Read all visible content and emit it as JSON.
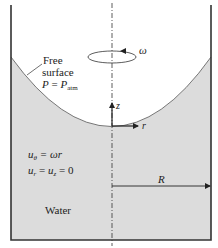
{
  "diagram": {
    "type": "rotating-tank-free-surface",
    "colors": {
      "background": "#ffffff",
      "water": "#dcdcdc",
      "lines": "#222222",
      "text": "#222222"
    },
    "labels": {
      "omega": "ω",
      "free_surface_line1": "Free",
      "free_surface_line2": "surface",
      "pressure_lhs": "P",
      "pressure_eq": " = ",
      "pressure_rhs": "P",
      "pressure_rhs_sub": "atm",
      "z_axis": "z",
      "r_axis": "r",
      "u_theta_var": "u",
      "u_theta_sub": "θ",
      "u_theta_rhs": " = ωr",
      "u_r_var": "u",
      "u_r_sub": "r",
      "u_eq": " = ",
      "u_z_var": "u",
      "u_z_sub": "z",
      "u_zero": " = 0",
      "radius": "R",
      "fluid": "Water"
    }
  }
}
